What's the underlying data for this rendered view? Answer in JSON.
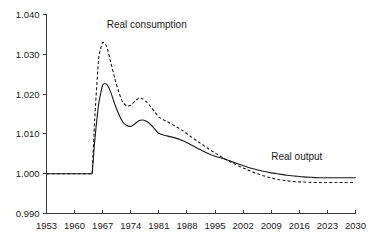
{
  "chart_data": {
    "type": "line",
    "title": "",
    "subtitle": "",
    "xlabel": "",
    "ylabel": "",
    "xlim": [
      1953,
      2030
    ],
    "ylim": [
      0.99,
      1.04
    ],
    "grid": false,
    "legend_position": "inline-annotations",
    "x_tick_labels": [
      "1953",
      "1960",
      "1967",
      "1974",
      "1981",
      "1988",
      "1995",
      "2002",
      "2009",
      "2016",
      "2023",
      "2030"
    ],
    "x_ticks": [
      1953,
      1960,
      1967,
      1974,
      1981,
      1988,
      1995,
      2002,
      2009,
      2016,
      2023,
      2030
    ],
    "y_tick_labels": [
      "0.990",
      "1.000",
      "1.010",
      "1.020",
      "1.030",
      "1.040"
    ],
    "y_ticks": [
      0.99,
      1.0,
      1.01,
      1.02,
      1.03,
      1.04
    ],
    "annotations": [
      {
        "text": "Real consumption",
        "x": 1968,
        "y": 1.0365,
        "series": "Real consumption"
      },
      {
        "text": "Real output",
        "x": 2009,
        "y": 1.0035,
        "series": "Real output"
      }
    ],
    "series": [
      {
        "name": "Real output",
        "style": "solid",
        "color": "#1a1a1a",
        "x": [
          1953,
          1955,
          1957,
          1959,
          1961,
          1963,
          1964,
          1964.4,
          1965,
          1966,
          1967,
          1968,
          1969,
          1970,
          1971,
          1972,
          1973,
          1974,
          1975,
          1976,
          1977,
          1978,
          1979,
          1980,
          1981,
          1983,
          1985,
          1987,
          1989,
          1991,
          1993,
          1995,
          1997,
          1999,
          2001,
          2003,
          2005,
          2007,
          2009,
          2011,
          2013,
          2015,
          2017,
          2019,
          2021,
          2023,
          2025,
          2027,
          2030
        ],
        "y": [
          1.0,
          1.0,
          1.0,
          1.0,
          1.0,
          1.0,
          1.0,
          1.0003,
          1.008,
          1.0175,
          1.0223,
          1.0225,
          1.0205,
          1.0175,
          1.015,
          1.013,
          1.0121,
          1.0119,
          1.0125,
          1.0133,
          1.0135,
          1.0131,
          1.0123,
          1.0112,
          1.0101,
          1.0095,
          1.009,
          1.0083,
          1.0073,
          1.0062,
          1.0052,
          1.0044,
          1.0038,
          1.0031,
          1.0024,
          1.0017,
          1.0011,
          1.0006,
          1.0002,
          0.9999,
          0.9996,
          0.9994,
          0.9992,
          0.9991,
          0.999,
          0.999,
          0.999,
          0.999,
          0.999
        ]
      },
      {
        "name": "Real consumption",
        "style": "dashed",
        "color": "#1a1a1a",
        "x": [
          1953,
          1955,
          1957,
          1959,
          1961,
          1963,
          1964,
          1964.4,
          1965,
          1966,
          1967,
          1968,
          1969,
          1970,
          1971,
          1972,
          1973,
          1974,
          1975,
          1976,
          1977,
          1978,
          1979,
          1980,
          1981,
          1983,
          1985,
          1987,
          1989,
          1991,
          1993,
          1995,
          1997,
          1999,
          2001,
          2003,
          2005,
          2007,
          2009,
          2011,
          2013,
          2015,
          2017,
          2019,
          2021,
          2023,
          2025,
          2027,
          2030
        ],
        "y": [
          1.0,
          1.0,
          1.0,
          1.0,
          1.0,
          1.0,
          1.0,
          1.0004,
          1.0135,
          1.029,
          1.033,
          1.032,
          1.028,
          1.024,
          1.0205,
          1.018,
          1.017,
          1.0172,
          1.0182,
          1.019,
          1.0188,
          1.018,
          1.0168,
          1.0155,
          1.0142,
          1.0131,
          1.012,
          1.0108,
          1.0093,
          1.0079,
          1.0065,
          1.0052,
          1.004,
          1.0029,
          1.0019,
          1.001,
          1.0002,
          0.9995,
          0.9989,
          0.9985,
          0.9982,
          0.998,
          0.9979,
          0.9978,
          0.9978,
          0.9978,
          0.9978,
          0.9978,
          0.9978
        ]
      }
    ]
  },
  "colors": {
    "background": "#ffffff",
    "axis": "#3a3a3a",
    "text": "#1a1a1a",
    "series": "#1a1a1a"
  }
}
